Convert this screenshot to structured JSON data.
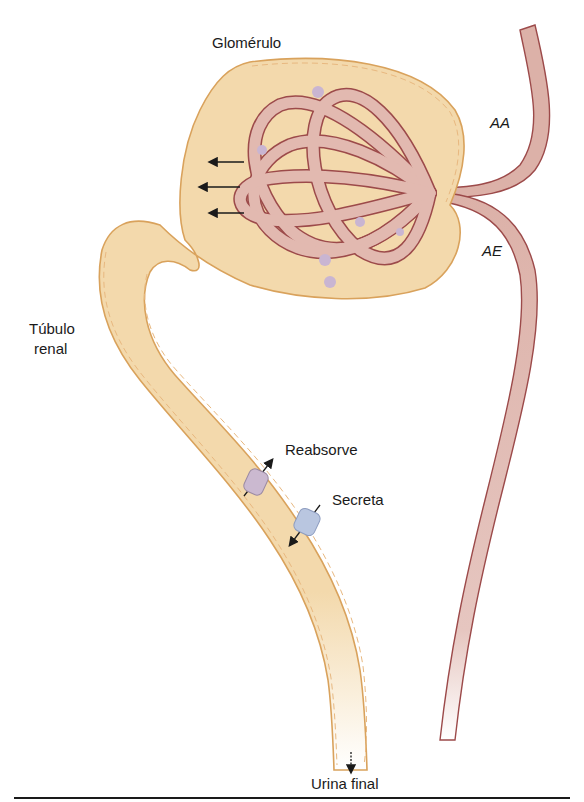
{
  "diagram": {
    "type": "nephron-schematic",
    "labels": {
      "glomerulus": "Glomérulo",
      "afferent_arteriole": "AA",
      "efferent_arteriole": "AE",
      "renal_tubule_line1": "Túbulo",
      "renal_tubule_line2": "renal",
      "reabsorb": "Reabsorve",
      "secrete": "Secreta",
      "final_urine": "Urina final"
    },
    "colors": {
      "tubule_fill": "#f3d9ac",
      "tubule_border": "#d9a25c",
      "vessel_fill": "#d9aaa2",
      "vessel_border": "#9c4a4a",
      "capillary_fill": "#e2b9b0",
      "reabsorb_transporter": "#cbb9d0",
      "secrete_transporter": "#b9c6e0",
      "arrow": "#1a1a1a"
    }
  }
}
